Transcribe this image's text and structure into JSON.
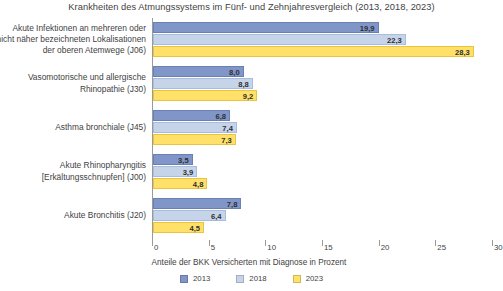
{
  "chart_data": {
    "type": "bar",
    "orientation": "horizontal",
    "title": "Krankheiten des Atmungssystems im Fünf- und Zehnjahresvergleich (2013, 2018, 2023)",
    "xlabel": "Anteile der BKK Versicherten mit Diagnose in Prozent",
    "ylabel": "",
    "xlim": [
      0,
      30
    ],
    "xticks": [
      "0",
      "5",
      "10",
      "15",
      "20",
      "25",
      "30"
    ],
    "grid": false,
    "legend_position": "bottom",
    "categories": [
      "Akute Infektionen an mehreren oder nicht näher bezeichneten Lokalisationen der oberen Atemwege (J06)",
      "Vasomotorische und allergische Rhinopathie (J30)",
      "Asthma bronchiale (J45)",
      "Akute Rhinopharyngitis [Erkältungsschnupfen] (J00)",
      "Akute Bronchitis (J20)"
    ],
    "category_lines": [
      [
        "Akute Infektionen an mehreren oder",
        "nicht näher bezeichneten Lokalisationen",
        "der oberen Atemwege (J06)"
      ],
      [
        "Vasomotorische und allergische",
        "Rhinopathie (J30)"
      ],
      [
        "Asthma bronchiale (J45)"
      ],
      [
        "Akute Rhinopharyngitis",
        "[Erkältungsschnupfen] (J00)"
      ],
      [
        "Akute Bronchitis (J20)"
      ]
    ],
    "series": [
      {
        "name": "2013",
        "color": "#8096c8",
        "values": [
          19.9,
          8.0,
          6.8,
          3.5,
          7.8
        ],
        "labels": [
          "19,9",
          "8,0",
          "6,8",
          "3,5",
          "7,8"
        ]
      },
      {
        "name": "2018",
        "color": "#c6d4ea",
        "values": [
          22.3,
          8.8,
          7.4,
          3.9,
          6.4
        ],
        "labels": [
          "22,3",
          "8,8",
          "7,4",
          "3,9",
          "6,4"
        ]
      },
      {
        "name": "2023",
        "color": "#ffe169",
        "values": [
          28.3,
          9.2,
          7.3,
          4.8,
          4.5
        ],
        "labels": [
          "28,3",
          "9,2",
          "7,3",
          "4,8",
          "4,5"
        ]
      }
    ]
  },
  "legend": {
    "items": [
      {
        "label": "2013",
        "color": "#8096c8"
      },
      {
        "label": "2018",
        "color": "#c6d4ea"
      },
      {
        "label": "2023",
        "color": "#ffe169"
      }
    ]
  }
}
